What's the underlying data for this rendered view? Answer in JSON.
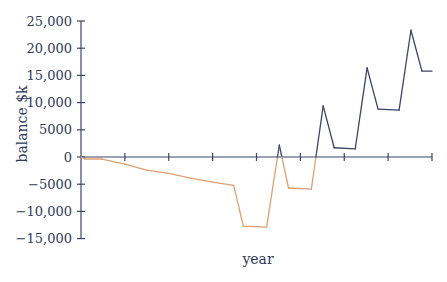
{
  "chart_data": {
    "type": "line",
    "title": "",
    "xlabel": "year",
    "ylabel": "balance $k",
    "ylim": [
      -15000,
      25000
    ],
    "yticks": [
      25000,
      20000,
      15000,
      10000,
      5000,
      0,
      -5000,
      -10000,
      -15000
    ],
    "ytick_labels": [
      "25,000",
      "20,000",
      "15,000",
      "10,000",
      "5000",
      "0",
      "−5000",
      "−10,000",
      "−15,000"
    ],
    "xticks_count": 8,
    "xtick_labels": [],
    "grid": false,
    "legend": null,
    "colors": {
      "negative": "#e0a070",
      "positive": "#3a4668",
      "axis": "#3a4668"
    },
    "series": [
      {
        "name": "balance",
        "x": [
          0,
          0.09,
          0.48,
          1.0,
          1.5,
          2.0,
          2.5,
          3.0,
          3.48,
          3.7,
          4.23,
          4.52,
          4.73,
          5.25,
          5.52,
          5.77,
          6.25,
          6.52,
          6.77,
          7.25,
          7.52,
          7.77,
          8.0
        ],
        "values": [
          0,
          -370,
          -370,
          -1300,
          -2400,
          -3000,
          -3900,
          -4600,
          -5200,
          -12700,
          -12900,
          2200,
          -5700,
          -5900,
          9400,
          1700,
          1500,
          16400,
          8800,
          8600,
          23300,
          15800,
          15800
        ]
      }
    ]
  }
}
